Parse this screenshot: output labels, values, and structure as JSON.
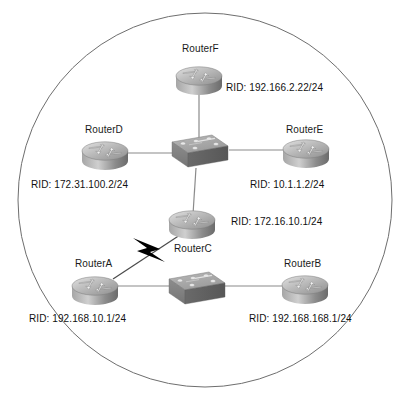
{
  "diagram": {
    "type": "network-topology",
    "boundary": {
      "shape": "circle",
      "stroke_color": "#6e6e6e",
      "center_x": 205,
      "center_y": 200,
      "radius": 187
    },
    "link_color": "#8a8a8a",
    "serial_link_color": "#000000",
    "device_body_color": "#9a9a9a",
    "device_shadow_color": "#5a5a5a",
    "devices": [
      {
        "id": "routerF",
        "kind": "router",
        "name": "RouterF",
        "rid": "RID: 192.166.2.22/24",
        "x": 199,
        "y": 76,
        "name_x": 182,
        "name_y": 43,
        "rid_x": 226,
        "rid_y": 82
      },
      {
        "id": "routerD",
        "kind": "router",
        "name": "RouterD",
        "rid": "RID: 172.31.100.2/24",
        "x": 105,
        "y": 153,
        "name_x": 85,
        "name_y": 124,
        "rid_x": 63,
        "rid_y": 179
      },
      {
        "id": "routerE",
        "kind": "router",
        "name": "RouterE",
        "rid": "RID: 10.1.1.2/24",
        "x": 306,
        "y": 153,
        "name_x": 286,
        "name_y": 124,
        "rid_x": 269,
        "rid_y": 179
      },
      {
        "id": "switch1",
        "kind": "switch",
        "name": "",
        "rid": "",
        "x": 199,
        "y": 153
      },
      {
        "id": "routerC",
        "kind": "router",
        "name": "RouterC",
        "rid": "RID: 172.16.10.1/24",
        "x": 192,
        "y": 222,
        "name_x": 174,
        "name_y": 243,
        "rid_x": 231,
        "rid_y": 216
      },
      {
        "id": "routerA",
        "kind": "router",
        "name": "RouterA",
        "rid": "RID: 192.168.10.1/24",
        "x": 95,
        "y": 288,
        "name_x": 75,
        "name_y": 258,
        "rid_x": 35,
        "rid_y": 313
      },
      {
        "id": "switch2",
        "kind": "switch",
        "name": "",
        "rid": "",
        "x": 196,
        "y": 292
      },
      {
        "id": "routerB",
        "kind": "router",
        "name": "RouterB",
        "rid": "RID: 192.168.168.1/24",
        "x": 305,
        "y": 288,
        "name_x": 284,
        "name_y": 258,
        "rid_x": 252,
        "rid_y": 313
      }
    ],
    "links": [
      {
        "id": "link-routerF-switch1",
        "from": "routerF",
        "to": "switch1",
        "style": "ethernet",
        "x1": 199,
        "y1": 90,
        "x2": 199,
        "y2": 140
      },
      {
        "id": "link-routerD-switch1",
        "from": "routerD",
        "to": "switch1",
        "style": "ethernet",
        "x1": 128,
        "y1": 153,
        "x2": 172,
        "y2": 153
      },
      {
        "id": "link-routerE-switch1",
        "from": "routerE",
        "to": "switch1",
        "style": "ethernet",
        "x1": 228,
        "y1": 153,
        "x2": 283,
        "y2": 153
      },
      {
        "id": "link-switch1-routerC",
        "from": "switch1",
        "to": "routerC",
        "style": "ethernet",
        "x1": 196,
        "y1": 170,
        "x2": 193,
        "y2": 212
      },
      {
        "id": "link-routerA-routerC",
        "from": "routerA",
        "to": "routerC",
        "style": "serial",
        "x1": 112,
        "y1": 280,
        "x2": 182,
        "y2": 234
      },
      {
        "id": "link-routerA-switch2",
        "from": "routerA",
        "to": "switch2",
        "style": "ethernet",
        "x1": 118,
        "y1": 288,
        "x2": 172,
        "y2": 288
      },
      {
        "id": "link-switch2-routerB",
        "from": "switch2",
        "to": "routerB",
        "style": "ethernet",
        "x1": 226,
        "y1": 288,
        "x2": 283,
        "y2": 288
      }
    ],
    "serial_marker": {
      "id": "serial-lightning-bolt",
      "center_x": 147,
      "center_y": 256
    }
  }
}
